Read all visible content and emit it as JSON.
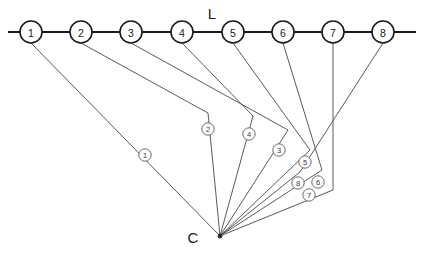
{
  "diagram": {
    "title_annotations": [
      {
        "name": "backbone-label",
        "text": "L",
        "x": 212,
        "y": 13
      },
      {
        "name": "hub-label",
        "text": "C",
        "x": 193,
        "y": 237
      }
    ],
    "backbone": {
      "name": "horizontal-line-L",
      "y": 32,
      "x_start": 8,
      "x_end": 416,
      "node_radius": 11
    },
    "hub": {
      "name": "convergence-point-C",
      "x": 220,
      "y": 236,
      "radius": 2.4
    },
    "top_nodes": [
      {
        "id": "top-node-1",
        "label": "1",
        "x": 31,
        "y": 32
      },
      {
        "id": "top-node-2",
        "label": "2",
        "x": 81,
        "y": 32
      },
      {
        "id": "top-node-3",
        "label": "3",
        "x": 131,
        "y": 32
      },
      {
        "id": "top-node-4",
        "label": "4",
        "x": 182,
        "y": 32
      },
      {
        "id": "top-node-5",
        "label": "5",
        "x": 233,
        "y": 32
      },
      {
        "id": "top-node-6",
        "label": "6",
        "x": 283,
        "y": 32
      },
      {
        "id": "top-node-7",
        "label": "7",
        "x": 333,
        "y": 32
      },
      {
        "id": "top-node-8",
        "label": "8",
        "x": 383,
        "y": 32
      }
    ],
    "edges": [
      {
        "id": "edge-1",
        "label": "1",
        "from_node": "1",
        "points": "31,43 220,236",
        "label_x": 145,
        "label_y": 155
      },
      {
        "id": "edge-2",
        "label": "2",
        "from_node": "2",
        "points": "81,43 208,113 220,236",
        "label_x": 208,
        "label_y": 129
      },
      {
        "id": "edge-3",
        "label": "3",
        "from_node": "3",
        "points": "131,43 288,130 220,236",
        "label_x": 279,
        "label_y": 150
      },
      {
        "id": "edge-4",
        "label": "4",
        "from_node": "4",
        "points": "182,43 253,116 220,236",
        "label_x": 249,
        "label_y": 134
      },
      {
        "id": "edge-5",
        "label": "5",
        "from_node": "5",
        "points": "233,43 310,150 220,236",
        "label_x": 305,
        "label_y": 162
      },
      {
        "id": "edge-6",
        "label": "6",
        "from_node": "6",
        "points": "283,43 322,170 220,236",
        "label_x": 318,
        "label_y": 182
      },
      {
        "id": "edge-7",
        "label": "7",
        "from_node": "7",
        "points": "333,43 333,190 220,236",
        "label_x": 309,
        "label_y": 195
      },
      {
        "id": "edge-8",
        "label": "8",
        "from_node": "8",
        "points": "383,43 300,172 220,236",
        "label_x": 298,
        "label_y": 183
      }
    ],
    "label_circle_radius": 6.2
  }
}
